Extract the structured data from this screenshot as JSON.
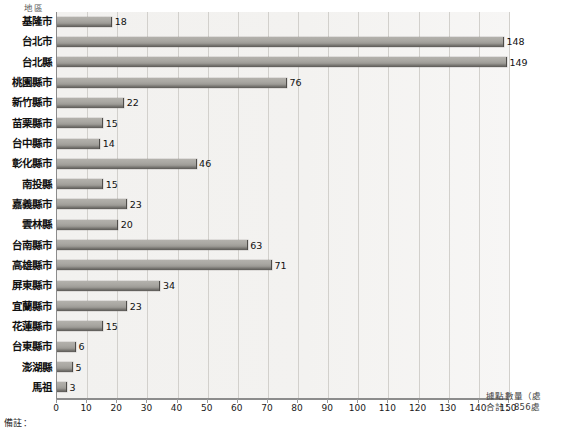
{
  "chart_data": {
    "type": "bar",
    "orientation": "horizontal",
    "title": "",
    "xlabel": "據點數量（處",
    "ylabel": "地區",
    "xlim": [
      0,
      150
    ],
    "xticks": [
      0,
      10,
      20,
      30,
      40,
      50,
      60,
      70,
      80,
      90,
      100,
      110,
      120,
      130,
      140,
      150
    ],
    "grid": true,
    "legend": "",
    "categories": [
      "基隆市",
      "台北市",
      "台北縣",
      "桃園縣市",
      "新竹縣市",
      "苗栗縣市",
      "台中縣市",
      "彰化縣市",
      "南投縣",
      "嘉義縣市",
      "雲林縣",
      "台南縣市",
      "高雄縣市",
      "屏東縣市",
      "宜蘭縣市",
      "花蓮縣市",
      "台東縣市",
      "澎湖縣",
      "馬祖"
    ],
    "values": [
      18,
      148,
      149,
      76,
      22,
      15,
      14,
      46,
      15,
      23,
      20,
      63,
      71,
      34,
      23,
      15,
      6,
      5,
      3
    ],
    "annotations": {
      "total_label": "合計：856處",
      "unit_label": "據點數量（處",
      "note_label": "備註："
    }
  },
  "colors": {
    "bar_fill": "#a9a7a2",
    "bar_edge": "#4e4c49",
    "plot_background": "#f2f1ef",
    "gridline": "#d2d0cc",
    "axis": "#8c8c8c",
    "text": "#111111"
  }
}
